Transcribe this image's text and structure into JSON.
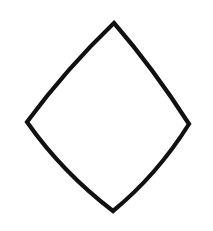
{
  "canvas": {
    "width": 213,
    "height": 231,
    "background_color": "#ffffff",
    "label": "drawing-canvas"
  },
  "drawing": {
    "title": "Diamond",
    "description": "Hand-drawn diamond (lozenge) outline with slightly concave edges",
    "style": "hand-drawn ink outline",
    "stroke_color": "#111111",
    "fill_color": "none",
    "stroke_width": 4.2,
    "shape_name": "diamond-outline",
    "vertices": [
      {
        "name": "top",
        "x": 114,
        "y": 23
      },
      {
        "name": "right",
        "x": 189,
        "y": 124
      },
      {
        "name": "bottom",
        "x": 113,
        "y": 211
      },
      {
        "name": "left",
        "x": 27,
        "y": 122
      }
    ],
    "edges": [
      {
        "name": "top-right-edge",
        "from": "top",
        "to": "right",
        "curvature": "concave",
        "control_x": 153,
        "control_y": 68
      },
      {
        "name": "bottom-right-edge",
        "from": "right",
        "to": "bottom",
        "curvature": "concave",
        "control_x": 157,
        "control_y": 175
      },
      {
        "name": "bottom-left-edge",
        "from": "bottom",
        "to": "left",
        "curvature": "concave",
        "control_x": 62,
        "control_y": 172
      },
      {
        "name": "top-left-edge",
        "from": "left",
        "to": "top",
        "curvature": "concave",
        "control_x": 66,
        "control_y": 69
      }
    ],
    "path_d": "M 114 23 Q 153 68 189 124 Q 157 175 113 211 Q 62 172 27 122 Q 66 69 114 23 Z"
  }
}
